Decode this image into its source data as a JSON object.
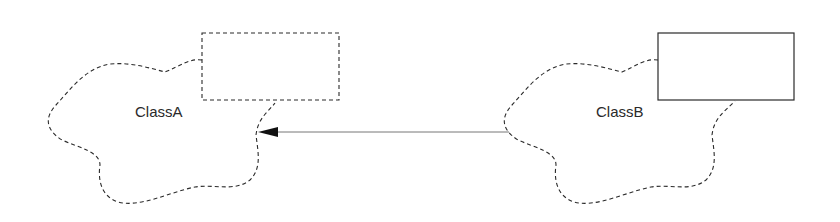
{
  "diagram": {
    "type": "booch-class-diagram",
    "classes": [
      {
        "id": "classA",
        "name": "ClassA",
        "box_style": "dashed"
      },
      {
        "id": "classB",
        "name": "ClassB",
        "box_style": "solid"
      }
    ],
    "relationships": [
      {
        "from": "ClassB",
        "to": "ClassA",
        "kind": "association-arrow"
      }
    ],
    "colors": {
      "stroke": "#2a2a2a",
      "arrow_line": "#777777",
      "background": "#ffffff"
    }
  }
}
